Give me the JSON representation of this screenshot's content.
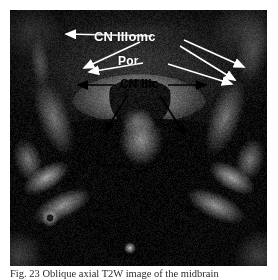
{
  "figure": {
    "kind": "medical-image-figure",
    "modality_note": "axial T2-weighted MR image",
    "caption": "Fig. 23 Oblique axial T2W image of the midbrain",
    "background_color": "#ffffff",
    "image_panel": {
      "x": 10,
      "y": 10,
      "width": 257,
      "height": 256,
      "base_color": "#0b0b0b"
    }
  },
  "labels": [
    {
      "id": "cn3omc",
      "text": "CN IIIomc",
      "color": "#ffffff",
      "x": 84,
      "y": 20,
      "font_size": 13
    },
    {
      "id": "por",
      "text": "Por",
      "color": "#ffffff",
      "x": 108,
      "y": 45,
      "font_size": 12
    },
    {
      "id": "cn3c",
      "text": "CN IIIc",
      "color": "#000000",
      "x": 110,
      "y": 68,
      "font_size": 12
    }
  ],
  "annotations": {
    "white_arrows": [
      {
        "id": "cn3omc-left-horizontal",
        "x1": 142,
        "y1": 26,
        "x2": 56,
        "y2": 24
      },
      {
        "id": "cn3omc-left-diagonal",
        "x1": 130,
        "y1": 32,
        "x2": 74,
        "y2": 58
      },
      {
        "id": "por-left-diagonal",
        "x1": 133,
        "y1": 53,
        "x2": 79,
        "y2": 62
      },
      {
        "id": "cn3omc-right-diagonal-outer",
        "x1": 174,
        "y1": 30,
        "x2": 234,
        "y2": 57
      },
      {
        "id": "cn3omc-right-diagonal-inner",
        "x1": 170,
        "y1": 36,
        "x2": 225,
        "y2": 70
      },
      {
        "id": "por-right-diagonal",
        "x1": 158,
        "y1": 54,
        "x2": 222,
        "y2": 74
      }
    ],
    "black_arrows": [
      {
        "id": "cn3c-left-horizontal",
        "x1": 104,
        "y1": 75,
        "x2": 68,
        "y2": 75
      },
      {
        "id": "cn3c-right-horizontal",
        "x1": 158,
        "y1": 75,
        "x2": 196,
        "y2": 75
      },
      {
        "id": "cn3c-left-diagonal-down",
        "x1": 117,
        "y1": 86,
        "x2": 95,
        "y2": 122
      },
      {
        "id": "cn3c-right-diagonal-down",
        "x1": 150,
        "y1": 86,
        "x2": 175,
        "y2": 125
      }
    ]
  },
  "anatomy_regions": [
    {
      "id": "midbrain-ventral",
      "description": "bright anterior midbrain band",
      "gray": 150
    },
    {
      "id": "interpeduncular-cistern",
      "description": "dark central cistern",
      "gray": 22
    },
    {
      "id": "temporal-bone-left",
      "description": "bright bony ridge left",
      "gray": 175
    },
    {
      "id": "temporal-bone-right",
      "description": "bright bony ridge right",
      "gray": 175
    },
    {
      "id": "basilar-artery",
      "description": "small bright round dot inferior",
      "gray": 205
    }
  ]
}
